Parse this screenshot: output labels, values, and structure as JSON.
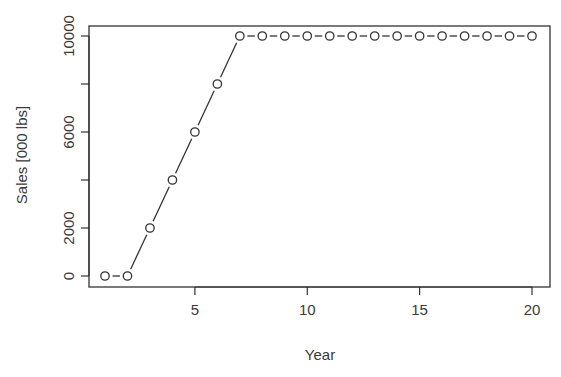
{
  "chart_data": {
    "type": "line",
    "title": "",
    "xlabel": "Year",
    "ylabel": "Sales [000 lbs]",
    "x": [
      1,
      2,
      3,
      4,
      5,
      6,
      7,
      8,
      9,
      10,
      11,
      12,
      13,
      14,
      15,
      16,
      17,
      18,
      19,
      20
    ],
    "series": [
      {
        "name": "Sales",
        "values": [
          0,
          0,
          2000,
          4000,
          6000,
          8000,
          10000,
          10000,
          10000,
          10000,
          10000,
          10000,
          10000,
          10000,
          10000,
          10000,
          10000,
          10000,
          10000,
          10000
        ],
        "style": "points-and-lines",
        "marker": "open-circle"
      }
    ],
    "xlim": [
      0.25,
      20.8
    ],
    "ylim": [
      -400,
      10400
    ],
    "xticks": [
      5,
      10,
      15,
      20
    ],
    "xtick_labels": [
      "5",
      "10",
      "15",
      "20"
    ],
    "yticks": [
      0,
      2000,
      4000,
      6000,
      8000,
      10000
    ],
    "ytick_labels": [
      "0",
      "2000",
      "",
      "6000",
      "",
      "10000"
    ],
    "grid": false,
    "legend": null,
    "colors": {
      "line": "#333333",
      "frame": "#333333",
      "background": "#ffffff"
    }
  }
}
